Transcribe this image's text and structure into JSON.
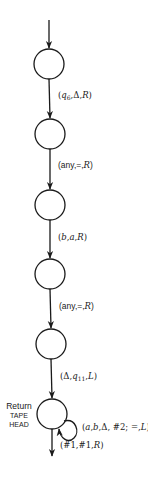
{
  "diagram": {
    "type": "state-machine",
    "colors": {
      "stroke": "#1a1a1a",
      "background": "#ffffff"
    },
    "states": [
      {
        "id": "s1",
        "label": ""
      },
      {
        "id": "s2",
        "label": ""
      },
      {
        "id": "s3",
        "label": ""
      },
      {
        "id": "s4",
        "label": ""
      },
      {
        "id": "s5",
        "label": ""
      },
      {
        "id": "s6",
        "label": "",
        "side_label": [
          "Return",
          "Tape",
          "Head"
        ]
      }
    ],
    "side_label": {
      "line1": "Return",
      "line2": "TAPE",
      "line3": "HEAD"
    },
    "transitions": [
      {
        "from": "start",
        "to": "s1",
        "label": ""
      },
      {
        "from": "s1",
        "to": "s2",
        "label": "(q6,Δ,R)",
        "parts": {
          "open": "(",
          "q": "q",
          "sub": "6",
          "rest": ",Δ,",
          "dir": "R",
          "close": ")"
        }
      },
      {
        "from": "s2",
        "to": "s3",
        "label": "(any,=,R)",
        "parts": {
          "open": "(any,=,",
          "dir": "R",
          "close": ")"
        }
      },
      {
        "from": "s3",
        "to": "s4",
        "label": "(b,a,R)",
        "parts": {
          "open": "(",
          "a1": "b",
          "sep1": ",",
          "a2": "a",
          "sep2": ",",
          "dir": "R",
          "close": ")"
        }
      },
      {
        "from": "s4",
        "to": "s5",
        "label": "(any,=,R)",
        "parts": {
          "open": "(any,=,",
          "dir": "R",
          "close": ")"
        }
      },
      {
        "from": "s5",
        "to": "s6",
        "label": "(Δ,q11,L)",
        "parts": {
          "open": "(Δ,",
          "q": "q",
          "sub": "11",
          "sep": ",",
          "dir": "L",
          "close": ")"
        }
      },
      {
        "from": "s6",
        "to": "s6",
        "label": "(a,b,Δ, #2; =,L)",
        "parts": {
          "open": "(",
          "a": "a",
          "sep1": ",",
          "b": "b",
          "rest": ",Δ, #2; =,",
          "dir": "L",
          "close": ")"
        }
      },
      {
        "from": "s6",
        "to": "exit",
        "label": "(#1,#1,R)",
        "parts": {
          "open": "(#1,#1,",
          "dir": "R",
          "close": ")"
        }
      }
    ]
  }
}
